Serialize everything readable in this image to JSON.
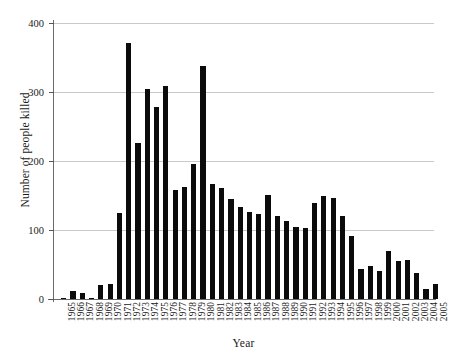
{
  "chart_data": {
    "type": "bar",
    "title": "",
    "xlabel": "Year",
    "ylabel": "Number of people killed",
    "categories": [
      "1965",
      "1966",
      "1967",
      "1968",
      "1969",
      "1970",
      "1971",
      "1972",
      "1973",
      "1974",
      "1975",
      "1976",
      "1977",
      "1978",
      "1979",
      "1980",
      "1981",
      "1982",
      "1983",
      "1984",
      "1985",
      "1986",
      "1987",
      "1988",
      "1989",
      "1990",
      "1991",
      "1992",
      "1993",
      "1994",
      "1995",
      "1996",
      "1997",
      "1998",
      "1999",
      "2000",
      "2001",
      "2002",
      "2003",
      "2004",
      "2005"
    ],
    "values": [
      2,
      11,
      8,
      2,
      21,
      22,
      124,
      371,
      226,
      305,
      279,
      309,
      158,
      163,
      195,
      338,
      167,
      161,
      145,
      133,
      126,
      123,
      151,
      120,
      113,
      104,
      103,
      139,
      150,
      146,
      121,
      92,
      44,
      48,
      41,
      70,
      55,
      57,
      37,
      14,
      22
    ],
    "ylim": [
      0,
      400
    ],
    "yticks": [
      0,
      100,
      200,
      300,
      400
    ],
    "ytick_labels": [
      "0",
      "100",
      "200",
      "300",
      "400"
    ],
    "grid": true,
    "legend": "none",
    "bar_color": "#0b0b0b",
    "grid_color": "#c9c9c9",
    "axis_color": "#6b6b6b"
  }
}
